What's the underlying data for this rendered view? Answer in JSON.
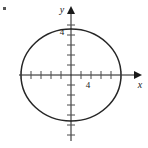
{
  "figure": {
    "kind": "ellipse-graph",
    "background_color": "#ffffff",
    "curve_color": "#262626",
    "axis_color": "#1a1a1a",
    "tick_color": "#4a4a4a",
    "corner_mark": "•"
  },
  "axes": {
    "x_label": "x",
    "y_label": "y",
    "origin_px": {
      "x": 71,
      "y": 75
    },
    "unit_px": 10,
    "x_axis_start_px": 19,
    "x_axis_end_px": 138,
    "y_axis_top_px": 9,
    "y_axis_bottom_px": 141,
    "x_ticks": [
      -5,
      -4,
      -3,
      -2,
      -1,
      1,
      2,
      3,
      4,
      5
    ],
    "y_ticks": [
      -6,
      -5,
      -4,
      -3,
      -2,
      -1,
      1,
      2,
      3,
      4,
      5
    ],
    "x_tick_labels": [
      {
        "value": 4,
        "text": "4"
      }
    ],
    "y_tick_labels": [
      {
        "value": 4,
        "text": "4"
      }
    ]
  },
  "chart_data": {
    "type": "line",
    "title": "",
    "xlabel": "x",
    "ylabel": "y",
    "grid": false,
    "legend": "none",
    "xlim": [
      -5.2,
      6.7
    ],
    "ylim": [
      -6.6,
      6.6
    ],
    "series": [
      {
        "name": "ellipse",
        "shape": "ellipse",
        "center": [
          0,
          0
        ],
        "semi_axis_x": 5,
        "semi_axis_y": 4.6,
        "equation": "x^2/25 + y^2/21.16 = 1",
        "closed": true
      }
    ],
    "annotations": [
      {
        "text": "4",
        "x": 4,
        "y": -1.0,
        "anchor": "x-axis-tick-label"
      },
      {
        "text": "4",
        "x": -1.0,
        "y": 4,
        "anchor": "y-axis-tick-label"
      }
    ]
  }
}
